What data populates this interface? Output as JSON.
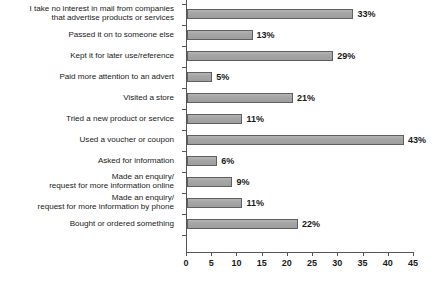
{
  "chart_data": {
    "type": "bar",
    "orientation": "horizontal",
    "title": "",
    "subtitle": "",
    "xlabel": "",
    "ylabel": "",
    "xlim": [
      0,
      45
    ],
    "xticks": [
      0,
      5,
      10,
      15,
      20,
      25,
      30,
      35,
      40,
      45
    ],
    "grid": false,
    "legend": null,
    "value_suffix": "%",
    "categories": [
      "I take no interest in mail from companies that advertise products or services",
      "Passed it on to someone else",
      "Kept it for later use/reference",
      "Paid more attention to an advert",
      "Visited a store",
      "Tried a new product or service",
      "Used a voucher or coupon",
      "Asked for information",
      "Made an enquiry/request for more information online",
      "Made an enquiry/request for more information by phone",
      "Bought or ordered something"
    ],
    "category_lines": [
      [
        "I take no interest in mail from companies",
        "that advertise products or services"
      ],
      [
        "Passed it on to someone else"
      ],
      [
        "Kept it for later use/reference"
      ],
      [
        "Paid more attention to an advert"
      ],
      [
        "Visited a store"
      ],
      [
        "Tried a new product or service"
      ],
      [
        "Used a voucher or coupon"
      ],
      [
        "Asked for information"
      ],
      [
        "Made an enquiry/",
        "request for more information online"
      ],
      [
        "Made an enquiry/",
        "request for more information by phone"
      ],
      [
        "Bought or ordered something"
      ]
    ],
    "values": [
      33,
      13,
      29,
      5,
      21,
      11,
      43,
      6,
      9,
      11,
      22
    ],
    "value_labels": [
      "33%",
      "13%",
      "29%",
      "5%",
      "21%",
      "11%",
      "43%",
      "6%",
      "9%",
      "11%",
      "22%"
    ],
    "bar_color": "#a8a8a8",
    "bar_border_color": "#5f5f5f",
    "axis_color": "#555555",
    "background_color": "#ffffff",
    "text_color": "#1a1a1a"
  }
}
